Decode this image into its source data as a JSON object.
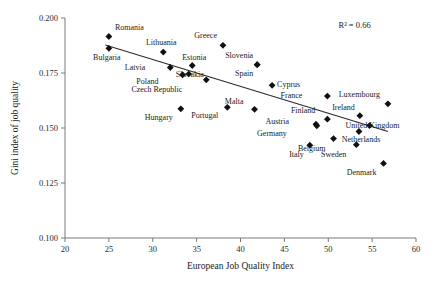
{
  "chart_data": {
    "type": "scatter",
    "title": "",
    "xlabel": "European Job Quality Index",
    "ylabel": "Gini index of job quality",
    "xlim": [
      20,
      60
    ],
    "ylim": [
      0.1,
      0.2
    ],
    "xticks": [
      "20",
      "25",
      "30",
      "35",
      "40",
      "45",
      "50",
      "55",
      "60"
    ],
    "yticks": [
      "0.100",
      "0.125",
      "0.150",
      "0.175",
      "0.200"
    ],
    "grid": false,
    "legend": null,
    "annotations": [
      {
        "name": "r-squared",
        "text": "R² = 0.66",
        "x": 53.0,
        "y": 0.1955
      }
    ],
    "trendline": {
      "type": "linear",
      "x_start": 24.6,
      "y_start": 0.1877,
      "x_end": 56.8,
      "y_end": 0.1484
    },
    "points": [
      {
        "label": "Romania",
        "x": 25.0,
        "y": 0.1916,
        "label_dx": 6,
        "label_dy": -6
      },
      {
        "label": "Bulgaria",
        "x": 25.0,
        "y": 0.1862,
        "label_dx": -2,
        "label_dy": 12
      },
      {
        "label": "Lithuania",
        "x": 31.2,
        "y": 0.1845,
        "label_dx": -2,
        "label_dy": -7
      },
      {
        "label": "Latvia",
        "x": 32.0,
        "y": 0.1775,
        "label_dx": -25,
        "label_dy": 2
      },
      {
        "label": "Poland",
        "x": 33.4,
        "y": 0.1742,
        "label_dx": -24,
        "label_dy": 9
      },
      {
        "label": "Hungary",
        "x": 33.2,
        "y": 0.1587,
        "label_dx": -8,
        "label_dy": 11
      },
      {
        "label": "Slovakia",
        "x": 34.1,
        "y": 0.1746,
        "label_dx": 1,
        "label_dy": 3
      },
      {
        "label": "Estonia",
        "x": 34.5,
        "y": 0.1784,
        "label_dx": 2,
        "label_dy": -6
      },
      {
        "label": "Czech Republic",
        "x": 36.1,
        "y": 0.1719,
        "label_dx": -24,
        "label_dy": 12
      },
      {
        "label": "Greece",
        "x": 38.0,
        "y": 0.1876,
        "label_dx": -6,
        "label_dy": -7
      },
      {
        "label": "Portugal",
        "x": 38.5,
        "y": 0.1594,
        "label_dx": -9,
        "label_dy": 11
      },
      {
        "label": "Malta",
        "x": 41.6,
        "y": 0.1585,
        "label_dx": -11,
        "label_dy": -5
      },
      {
        "label": "Slovenia",
        "x": 41.9,
        "y": 0.1788,
        "label_dx": -4,
        "label_dy": -7
      },
      {
        "label": "Spain",
        "x": 41.9,
        "y": 0.1788,
        "label_dx": -4,
        "label_dy": 11
      },
      {
        "label": "Cyprus",
        "x": 43.6,
        "y": 0.1694,
        "label_dx": 5,
        "label_dy": 2
      },
      {
        "label": "Italy",
        "x": 47.9,
        "y": 0.1422,
        "label_dx": -6,
        "label_dy": 12
      },
      {
        "label": "Austria",
        "x": 48.6,
        "y": 0.1517,
        "label_dx": -27,
        "label_dy": 0
      },
      {
        "label": "Germany",
        "x": 48.7,
        "y": 0.151,
        "label_dx": -30,
        "label_dy": 10
      },
      {
        "label": "France",
        "x": 49.9,
        "y": 0.1645,
        "label_dx": -25,
        "label_dy": 2
      },
      {
        "label": "Finland",
        "x": 49.9,
        "y": 0.154,
        "label_dx": -12,
        "label_dy": -6
      },
      {
        "label": "Belgium",
        "x": 50.6,
        "y": 0.1452,
        "label_dx": -8,
        "label_dy": 12
      },
      {
        "label": "Sweden",
        "x": 53.2,
        "y": 0.1424,
        "label_dx": -10,
        "label_dy": 12
      },
      {
        "label": "Ireland",
        "x": 53.6,
        "y": 0.1556,
        "label_dx": -5,
        "label_dy": -6
      },
      {
        "label": "Netherlands",
        "x": 53.5,
        "y": 0.1484,
        "label_dx": 2,
        "label_dy": 10
      },
      {
        "label": "United Kingdom",
        "x": 54.7,
        "y": 0.1511,
        "label_dx": 3,
        "label_dy": 2
      },
      {
        "label": "Luxembourg",
        "x": 56.8,
        "y": 0.161,
        "label_dx": -8,
        "label_dy": -7
      },
      {
        "label": "Denmark",
        "x": 56.3,
        "y": 0.1339,
        "label_dx": -7,
        "label_dy": 12
      }
    ]
  }
}
